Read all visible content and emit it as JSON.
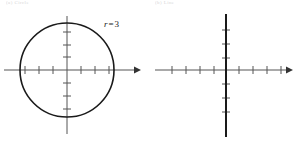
{
  "figure": {
    "background_color": "#ffffff",
    "ink_color": "#1a1a1a",
    "axis_color": "#555555",
    "panels": [
      {
        "id": "left",
        "caption": "(a) Circle",
        "graph_type": "polar-equation-graph",
        "curve": "circle",
        "label": {
          "variable": "r",
          "equals": "=",
          "value": "3"
        },
        "axes": {
          "x_arrow": "right",
          "y_ticks": 6,
          "x_ticks": 6,
          "origin_x": 67,
          "origin_y": 70
        },
        "circle": {
          "center_x": 67,
          "center_y": 70,
          "radius": 47
        }
      },
      {
        "id": "right",
        "caption": "(b) Line",
        "graph_type": "polar-equation-graph",
        "curve": "vertical-line",
        "label": {
          "variable": "θ",
          "equals": "=",
          "numerator": "π",
          "denominator": "2"
        },
        "axes": {
          "x_arrow": "right",
          "y_ticks": 6,
          "x_ticks": 8,
          "origin_x": 77,
          "origin_y": 70
        },
        "line": {
          "x": 77,
          "y_top": 14,
          "y_bottom": 136
        }
      }
    ]
  }
}
